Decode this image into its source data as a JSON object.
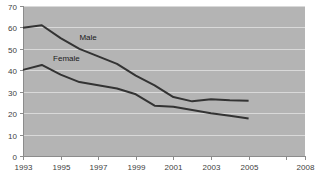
{
  "chart_data": {
    "type": "line",
    "title": "",
    "subtitle": "",
    "xlabel": "",
    "ylabel": "",
    "xlim": [
      1993,
      2008
    ],
    "ylim": [
      0,
      70
    ],
    "grid": true,
    "legend_position": "inline-annotation",
    "y_ticks": [
      0,
      10,
      20,
      30,
      40,
      50,
      60,
      70
    ],
    "y_tick_labels": [
      "0",
      "10",
      "20",
      "30",
      "40",
      "50",
      "60",
      "70"
    ],
    "x_ticks": [
      1993,
      1995,
      1997,
      1999,
      2001,
      2003,
      2005,
      2007,
      2008
    ],
    "x_tick_labels": [
      "1993",
      "1995",
      "1997",
      "1999",
      "2001",
      "2003",
      "2005",
      "",
      "2008"
    ],
    "x": [
      1993,
      1994,
      1995,
      1996,
      1997,
      1998,
      1999,
      2000,
      2001,
      2002,
      2003,
      2004,
      2005
    ],
    "series": [
      {
        "name": "Male",
        "label": "Male",
        "color": "#333333",
        "label_x": 1996.0,
        "label_y": 54.0,
        "values": [
          59.8,
          61.0,
          55.0,
          50.0,
          46.5,
          43.0,
          37.5,
          33.0,
          27.5,
          25.5,
          26.5,
          26.0,
          25.8
        ]
      },
      {
        "name": "Female",
        "label": "Female",
        "color": "#333333",
        "label_x": 1994.6,
        "label_y": 44.5,
        "values": [
          40.2,
          42.5,
          38.0,
          34.5,
          33.0,
          31.5,
          28.8,
          23.5,
          23.0,
          21.5,
          20.0,
          18.8,
          17.5
        ]
      }
    ]
  }
}
